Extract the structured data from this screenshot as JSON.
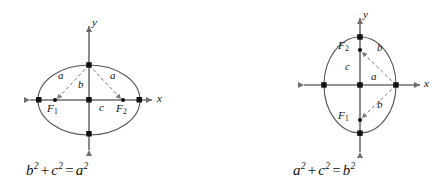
{
  "figure": {
    "colors": {
      "axis": "#6e6e6e",
      "ellipse": "#555555",
      "dashed": "#7a7a7a",
      "point": "#111111",
      "text": "#111111",
      "background": "#ffffff"
    },
    "panels": [
      {
        "id": "horizontal-ellipse",
        "orientation": "horizontal-major-axis",
        "center": {
          "x": 89,
          "y": 100
        },
        "radii": {
          "rx": 51,
          "ry": 35
        },
        "axis_labels": {
          "x": "x",
          "y": "y"
        },
        "foci": [
          {
            "name": "F_1",
            "label": "F",
            "subscript": "1",
            "x": 55,
            "y": 100
          },
          {
            "name": "F_2",
            "label": "F",
            "subscript": "2",
            "x": 123,
            "y": 100
          }
        ],
        "segment_labels": [
          {
            "name": "a-left",
            "text": "a",
            "x": 61,
            "y": 76
          },
          {
            "name": "a-right",
            "text": "a",
            "x": 113,
            "y": 76
          },
          {
            "name": "b-vertical",
            "text": "b",
            "x": 80,
            "y": 84
          },
          {
            "name": "c-horizontal",
            "text": "c",
            "x": 101,
            "y": 106
          }
        ],
        "equation": {
          "text": "b² + c² = a²",
          "terms": [
            {
              "base": "b",
              "exp": "2"
            },
            {
              "op": "+"
            },
            {
              "base": "c",
              "exp": "2"
            },
            {
              "op": "="
            },
            {
              "base": "a",
              "exp": "2"
            }
          ]
        }
      },
      {
        "id": "vertical-ellipse",
        "orientation": "vertical-major-axis",
        "center": {
          "x": 360,
          "y": 85
        },
        "radii": {
          "rx": 36,
          "ry": 48
        },
        "axis_labels": {
          "x": "x",
          "y": "y"
        },
        "foci": [
          {
            "name": "F_2",
            "label": "F",
            "subscript": "2",
            "x": 360,
            "y": 50
          },
          {
            "name": "F_1",
            "label": "F",
            "subscript": "1",
            "x": 360,
            "y": 120
          }
        ],
        "segment_labels": [
          {
            "name": "b-upper",
            "text": "b",
            "x": 380,
            "y": 48
          },
          {
            "name": "b-lower",
            "text": "b",
            "x": 380,
            "y": 104
          },
          {
            "name": "c-vertical",
            "text": "c",
            "x": 348,
            "y": 65
          },
          {
            "name": "a-horizontal",
            "text": "a",
            "x": 374,
            "y": 75
          }
        ],
        "equation": {
          "text": "a² + c² = b²",
          "terms": [
            {
              "base": "a",
              "exp": "2"
            },
            {
              "op": "+"
            },
            {
              "base": "c",
              "exp": "2"
            },
            {
              "op": "="
            },
            {
              "base": "b",
              "exp": "2"
            }
          ]
        }
      }
    ]
  }
}
